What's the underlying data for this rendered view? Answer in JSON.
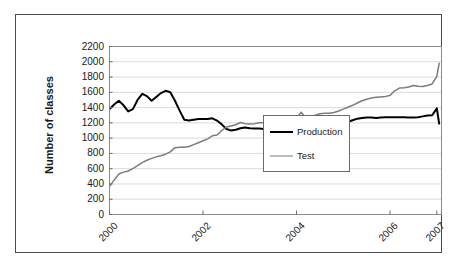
{
  "chart_data": {
    "type": "line",
    "title": "",
    "xlabel": "",
    "ylabel": "Number of classes",
    "ylim": [
      0,
      2200
    ],
    "ytick_step": 200,
    "yticks": [
      2200,
      2000,
      1800,
      1600,
      1400,
      1200,
      1000,
      800,
      600,
      400,
      200,
      0
    ],
    "ytick_labels": [
      "2200",
      "2000",
      "1800",
      "1600",
      "1400",
      "1200",
      "1000",
      "800",
      "600",
      "400",
      "200",
      "0"
    ],
    "xlim": [
      2000.0,
      2007.1
    ],
    "xticks": [
      2000,
      2002,
      2004,
      2006,
      2007
    ],
    "xtick_labels": [
      "2000",
      "2002",
      "2004",
      "2006",
      "2007"
    ],
    "grid": "horizontal",
    "grid_color": "#dcdcdc",
    "legend_position": "lower-right-inside",
    "legend_entries": [
      "Production",
      "Test"
    ],
    "x": [
      2000.0,
      2000.1,
      2000.2,
      2000.3,
      2000.4,
      2000.5,
      2000.6,
      2000.7,
      2000.8,
      2000.9,
      2001.0,
      2001.1,
      2001.2,
      2001.3,
      2001.4,
      2001.5,
      2001.6,
      2001.7,
      2001.8,
      2001.9,
      2002.0,
      2002.1,
      2002.2,
      2002.3,
      2002.4,
      2002.5,
      2002.6,
      2002.7,
      2002.8,
      2002.9,
      2003.0,
      2003.1,
      2003.2,
      2003.3,
      2003.4,
      2003.5,
      2003.6,
      2003.7,
      2003.8,
      2003.9,
      2004.0,
      2004.1,
      2004.2,
      2004.3,
      2004.4,
      2004.5,
      2004.6,
      2004.7,
      2004.8,
      2004.9,
      2005.0,
      2005.1,
      2005.2,
      2005.3,
      2005.4,
      2005.5,
      2005.6,
      2005.7,
      2005.8,
      2005.9,
      2006.0,
      2006.1,
      2006.2,
      2006.3,
      2006.4,
      2006.5,
      2006.6,
      2006.7,
      2006.8,
      2006.9,
      2007.0,
      2007.05
    ],
    "series": [
      {
        "name": "Production",
        "color": "#000000",
        "width": 2.0,
        "values": [
          1380,
          1440,
          1490,
          1430,
          1350,
          1380,
          1500,
          1580,
          1550,
          1490,
          1540,
          1590,
          1620,
          1600,
          1490,
          1360,
          1240,
          1230,
          1240,
          1250,
          1250,
          1250,
          1260,
          1230,
          1180,
          1120,
          1100,
          1110,
          1130,
          1140,
          1130,
          1125,
          1125,
          1120,
          1120,
          1120,
          1125,
          1130,
          1130,
          1140,
          1160,
          1195,
          1180,
          1180,
          1190,
          1190,
          1175,
          1165,
          1175,
          1195,
          1205,
          1215,
          1235,
          1255,
          1265,
          1270,
          1270,
          1265,
          1270,
          1275,
          1275,
          1275,
          1275,
          1275,
          1270,
          1270,
          1275,
          1285,
          1295,
          1300,
          1390,
          1190
        ]
      },
      {
        "name": "Test",
        "color": "#7d7d7d",
        "width": 1.5,
        "values": [
          370,
          450,
          530,
          555,
          570,
          600,
          640,
          680,
          710,
          735,
          755,
          770,
          790,
          820,
          875,
          880,
          880,
          890,
          915,
          940,
          965,
          990,
          1030,
          1040,
          1100,
          1145,
          1160,
          1175,
          1205,
          1190,
          1185,
          1190,
          1200,
          1205,
          1215,
          1225,
          1230,
          1240,
          1245,
          1255,
          1265,
          1340,
          1260,
          1285,
          1300,
          1320,
          1325,
          1325,
          1335,
          1355,
          1380,
          1405,
          1430,
          1460,
          1490,
          1510,
          1525,
          1535,
          1540,
          1545,
          1560,
          1620,
          1655,
          1660,
          1670,
          1690,
          1680,
          1675,
          1690,
          1710,
          1810,
          1980
        ]
      }
    ]
  },
  "legend": {
    "production_label": "Production",
    "test_label": "Test"
  },
  "axes": {
    "y_title": "Number of classes"
  }
}
